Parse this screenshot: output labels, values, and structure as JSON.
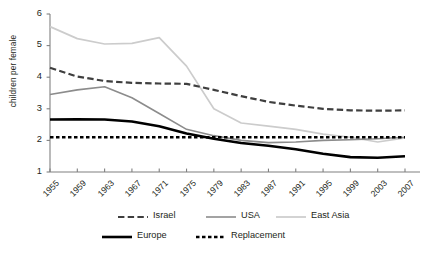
{
  "chart_data": {
    "type": "line",
    "title": "",
    "xlabel": "",
    "ylabel": "children per female",
    "xlim": [
      1955,
      2009
    ],
    "ylim": [
      1,
      6
    ],
    "grid": false,
    "legend_position": "bottom",
    "x": [
      1955,
      1959,
      1963,
      1967,
      1971,
      1975,
      1979,
      1983,
      1987,
      1991,
      1995,
      1999,
      2003,
      2007
    ],
    "categories": [
      "1955",
      "1959",
      "1963",
      "1967",
      "1971",
      "1975",
      "1979",
      "1983",
      "1987",
      "1991",
      "1995",
      "1999",
      "2003",
      "2007"
    ],
    "yticks": [
      1,
      2,
      3,
      4,
      5,
      6
    ],
    "yticklabels": [
      "1",
      "2",
      "3",
      "4",
      "5",
      "6"
    ],
    "series": [
      {
        "name": "Israel",
        "color": "#3f3f3f",
        "style": "dashed",
        "width": 2.2,
        "values": [
          4.3,
          4.02,
          3.88,
          3.82,
          3.8,
          3.79,
          3.6,
          3.4,
          3.22,
          3.1,
          3.0,
          2.95,
          2.94,
          2.95
        ]
      },
      {
        "name": "USA",
        "color": "#8c8c8c",
        "style": "solid",
        "width": 1.6,
        "values": [
          3.45,
          3.6,
          3.7,
          3.35,
          2.85,
          2.35,
          2.15,
          2.0,
          1.93,
          1.95,
          2.0,
          2.02,
          2.05,
          2.1
        ]
      },
      {
        "name": "East Asia",
        "color": "#cccccc",
        "style": "solid",
        "width": 1.7,
        "values": [
          5.6,
          5.22,
          5.05,
          5.07,
          5.25,
          4.35,
          3.0,
          2.55,
          2.45,
          2.35,
          2.2,
          2.1,
          1.95,
          2.08
        ]
      },
      {
        "name": "Europe",
        "color": "#000000",
        "style": "solid",
        "width": 2.6,
        "values": [
          2.66,
          2.67,
          2.66,
          2.6,
          2.45,
          2.22,
          2.05,
          1.92,
          1.83,
          1.72,
          1.58,
          1.47,
          1.45,
          1.5
        ]
      },
      {
        "name": "Replacement",
        "color": "#000000",
        "style": "dotted",
        "width": 2.4,
        "values": [
          2.1,
          2.1,
          2.1,
          2.1,
          2.1,
          2.1,
          2.1,
          2.1,
          2.1,
          2.1,
          2.1,
          2.1,
          2.1,
          2.1
        ]
      }
    ],
    "legend": [
      {
        "label": "Israel",
        "style": "dashed",
        "color": "#3f3f3f",
        "width": 2.2
      },
      {
        "label": "USA",
        "style": "solid",
        "color": "#8c8c8c",
        "width": 1.6
      },
      {
        "label": "East Asia",
        "style": "solid",
        "color": "#cccccc",
        "width": 1.7
      },
      {
        "label": "Europe",
        "style": "solid",
        "color": "#000000",
        "width": 2.6
      },
      {
        "label": "Replacement",
        "style": "dotted",
        "color": "#000000",
        "width": 2.4
      }
    ]
  },
  "axis": {
    "color": "#808080"
  }
}
